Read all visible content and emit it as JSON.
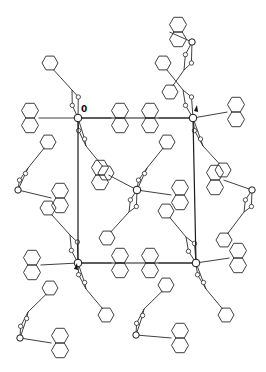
{
  "figure": {
    "type": "crystal-packing-diagram",
    "width": 266,
    "height": 372,
    "line_color": "#2a2a2a",
    "background": "#ffffff"
  },
  "unit_cell": {
    "corners": [
      [
        78,
        118
      ],
      [
        193,
        118
      ],
      [
        196,
        263
      ],
      [
        78,
        263
      ]
    ],
    "origin_label": "0",
    "origin_label_pos": [
      81,
      112
    ],
    "axis_marks": [
      {
        "name": "top-right-mark",
        "pos": [
          194,
          111
        ]
      },
      {
        "name": "bottom-left-mark",
        "pos": [
          74,
          269
        ]
      }
    ]
  },
  "metal_centers": [
    {
      "x": 78,
      "y": 118
    },
    {
      "x": 193,
      "y": 118
    },
    {
      "x": 78,
      "y": 263
    },
    {
      "x": 196,
      "y": 263
    },
    {
      "x": 137,
      "y": 190
    }
  ],
  "molecules": [
    {
      "id": "m1",
      "metal": [
        192,
        42
      ],
      "nap": [
        178,
        32
      ],
      "rot": 0,
      "flip": 1,
      "chain_dir": [
        -8,
        28
      ],
      "ph": [
        -22,
        50
      ],
      "ph_rot": -60
    },
    {
      "id": "m2",
      "metal": [
        78,
        118
      ],
      "nap": [
        30,
        118
      ],
      "rot": 0,
      "flip": -1,
      "chain_dir": [
        -6,
        -28
      ],
      "ph": [
        -28,
        -55
      ],
      "ph_rot": 60
    },
    {
      "id": "m3",
      "metal": [
        78,
        118
      ],
      "nap": [
        120,
        118
      ],
      "rot": 0,
      "flip": 1,
      "chain_dir": [
        8,
        28
      ],
      "ph": [
        28,
        55
      ],
      "ph_rot": 60
    },
    {
      "id": "m4",
      "metal": [
        193,
        118
      ],
      "nap": [
        236,
        112
      ],
      "rot": 0,
      "flip": 1,
      "chain_dir": [
        10,
        28
      ],
      "ph": [
        30,
        52
      ],
      "ph_rot": 60
    },
    {
      "id": "m5",
      "metal": [
        193,
        118
      ],
      "nap": [
        150,
        118
      ],
      "rot": 0,
      "flip": -1,
      "chain_dir": [
        -10,
        -28
      ],
      "ph": [
        -30,
        -55
      ],
      "ph_rot": 60
    },
    {
      "id": "m6",
      "metal": [
        137,
        190
      ],
      "nap": [
        100,
        175
      ],
      "rot": 0,
      "flip": -1,
      "chain_dir": [
        -8,
        22
      ],
      "ph": [
        -30,
        48
      ],
      "ph_rot": -60
    },
    {
      "id": "m7",
      "metal": [
        137,
        190
      ],
      "nap": [
        180,
        195
      ],
      "rot": 0,
      "flip": 1,
      "chain_dir": [
        10,
        -22
      ],
      "ph": [
        30,
        -48
      ],
      "ph_rot": -60
    },
    {
      "id": "m8",
      "metal": [
        18,
        190
      ],
      "nap": [
        60,
        198
      ],
      "rot": 0,
      "flip": 1,
      "chain_dir": [
        10,
        -22
      ],
      "ph": [
        30,
        -48
      ],
      "ph_rot": -60
    },
    {
      "id": "m9",
      "metal": [
        252,
        190
      ],
      "nap": [
        215,
        180
      ],
      "rot": 0,
      "flip": -1,
      "chain_dir": [
        -8,
        22
      ],
      "ph": [
        -28,
        50
      ],
      "ph_rot": -60
    },
    {
      "id": "m10",
      "metal": [
        78,
        263
      ],
      "nap": [
        32,
        265
      ],
      "rot": 0,
      "flip": -1,
      "chain_dir": [
        -8,
        -28
      ],
      "ph": [
        -30,
        -55
      ],
      "ph_rot": 60
    },
    {
      "id": "m11",
      "metal": [
        78,
        263
      ],
      "nap": [
        120,
        263
      ],
      "rot": 0,
      "flip": 1,
      "chain_dir": [
        8,
        26
      ],
      "ph": [
        28,
        52
      ],
      "ph_rot": 60
    },
    {
      "id": "m12",
      "metal": [
        196,
        263
      ],
      "nap": [
        150,
        263
      ],
      "rot": 0,
      "flip": -1,
      "chain_dir": [
        -10,
        -26
      ],
      "ph": [
        -30,
        -52
      ],
      "ph_rot": 60
    },
    {
      "id": "m13",
      "metal": [
        196,
        263
      ],
      "nap": [
        238,
        258
      ],
      "rot": 0,
      "flip": 1,
      "chain_dir": [
        10,
        26
      ],
      "ph": [
        30,
        52
      ],
      "ph_rot": 60
    },
    {
      "id": "m14",
      "metal": [
        20,
        338
      ],
      "nap": [
        60,
        343
      ],
      "rot": 0,
      "flip": 1,
      "chain_dir": [
        8,
        -26
      ],
      "ph": [
        30,
        -50
      ],
      "ph_rot": -60
    },
    {
      "id": "m15",
      "metal": [
        136,
        335
      ],
      "nap": [
        180,
        338
      ],
      "rot": 0,
      "flip": 1,
      "chain_dir": [
        8,
        -26
      ],
      "ph": [
        30,
        -50
      ],
      "ph_rot": -60
    }
  ]
}
